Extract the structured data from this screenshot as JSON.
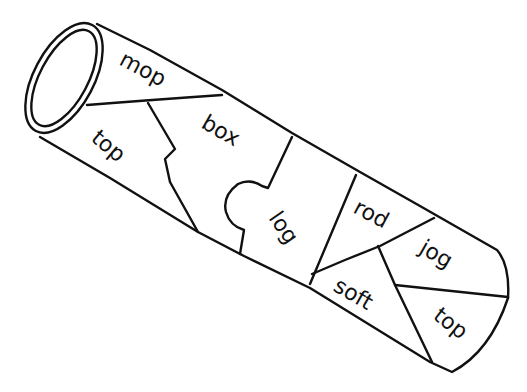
{
  "drawing": {
    "subject": "cardboard tube puzzle",
    "stroke_color": "#111111",
    "background_color": "#ffffff"
  },
  "words": [
    {
      "label": "mop",
      "x": 118,
      "y": 64,
      "rotate": 28
    },
    {
      "label": "top",
      "x": 90,
      "y": 140,
      "rotate": 40
    },
    {
      "label": "box",
      "x": 200,
      "y": 127,
      "rotate": 30
    },
    {
      "label": "log",
      "x": 268,
      "y": 218,
      "rotate": 55
    },
    {
      "label": "rod",
      "x": 352,
      "y": 212,
      "rotate": 28
    },
    {
      "label": "jog",
      "x": 418,
      "y": 252,
      "rotate": 30
    },
    {
      "label": "soft",
      "x": 332,
      "y": 290,
      "rotate": 30
    },
    {
      "label": "top",
      "x": 432,
      "y": 318,
      "rotate": 38
    }
  ]
}
